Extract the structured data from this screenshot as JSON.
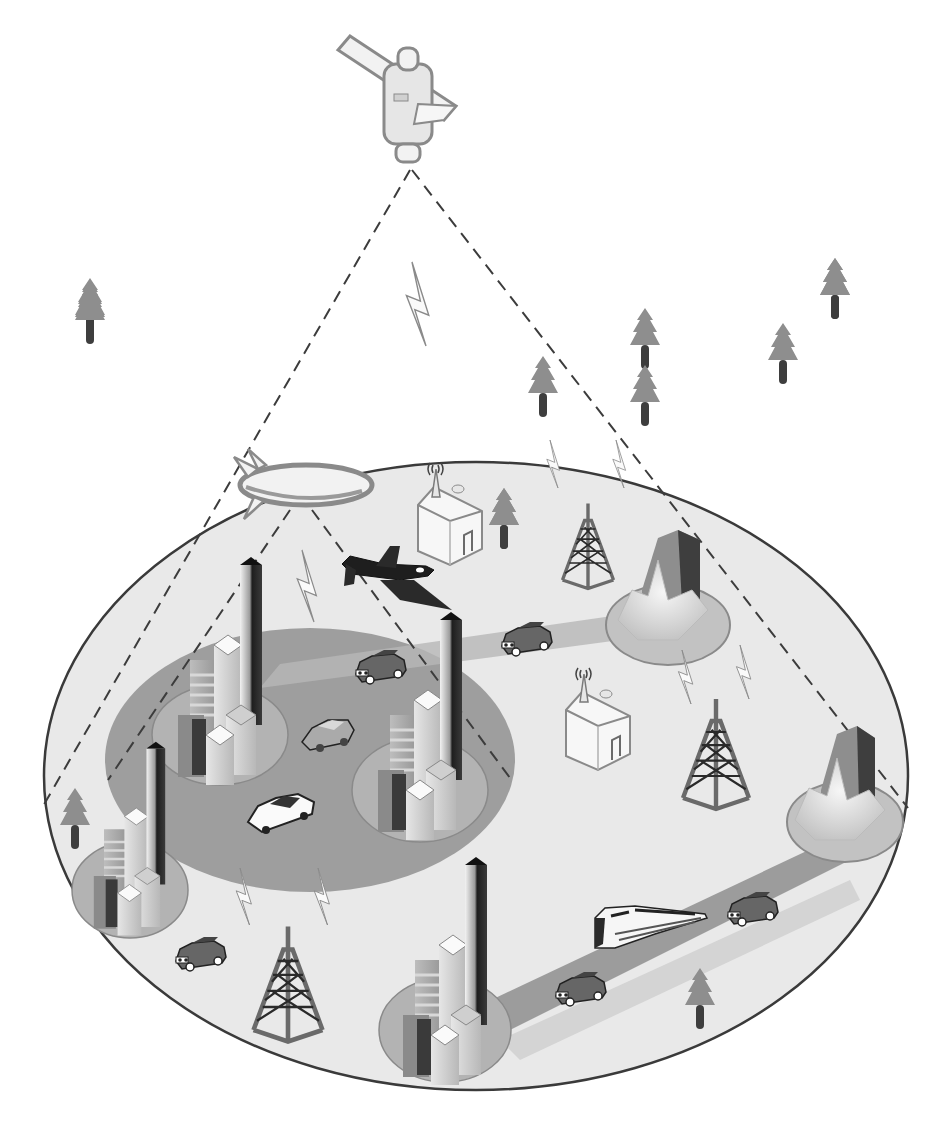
{
  "diagram": {
    "colors": {
      "background": "#ffffff",
      "ground": "#e9e9e9",
      "ground_outline": "#3a3a3a",
      "urban_zone": "#9a9a9a",
      "city_pad": "#b5b5b5",
      "road": "#a8a8a8",
      "dash": "#3c3c3c",
      "tree_crown": "#8e8e8e",
      "tree_trunk": "#3e3e3e",
      "tower": "#5a5a5a",
      "dark": "#222222",
      "light": "#f7f7f7"
    },
    "nodes": [
      {
        "id": "satellite",
        "label": "Satellite"
      },
      {
        "id": "blimp",
        "label": "High-altitude platform (airship)"
      },
      {
        "id": "aircraft",
        "label": "Aircraft"
      },
      {
        "id": "house-north",
        "label": "House with antenna"
      },
      {
        "id": "house-center",
        "label": "House with antenna"
      },
      {
        "id": "tower-north",
        "label": "Cell tower"
      },
      {
        "id": "tower-east",
        "label": "Cell tower"
      },
      {
        "id": "tower-south",
        "label": "Cell tower"
      },
      {
        "id": "city-northwest",
        "label": "City cluster"
      },
      {
        "id": "city-center",
        "label": "City cluster"
      },
      {
        "id": "city-west",
        "label": "City cluster"
      },
      {
        "id": "city-south",
        "label": "City cluster"
      },
      {
        "id": "town-northeast",
        "label": "Town"
      },
      {
        "id": "town-east",
        "label": "Town"
      },
      {
        "id": "train",
        "label": "High-speed train"
      },
      {
        "id": "cars",
        "label": "Vehicles",
        "count": 7
      },
      {
        "id": "trees",
        "label": "Trees",
        "count": 11
      }
    ],
    "links": [
      {
        "from": "satellite",
        "to": "ground-edge-left",
        "style": "dashed"
      },
      {
        "from": "satellite",
        "to": "ground-edge-right",
        "style": "dashed"
      },
      {
        "from": "blimp",
        "to": "urban-zone-left",
        "style": "dashed"
      },
      {
        "from": "blimp",
        "to": "urban-zone-right",
        "style": "dashed"
      }
    ]
  }
}
